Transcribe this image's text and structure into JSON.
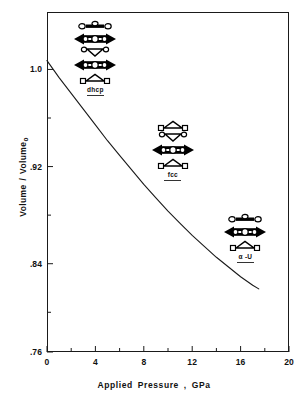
{
  "chart_data": {
    "type": "line",
    "title": "",
    "xlabel": "Applied  Pressure , GPa",
    "ylabel": "Volume / Volume",
    "ylabel_subscript": "o",
    "xlim": [
      0,
      20
    ],
    "ylim": [
      0.76,
      1.04
    ],
    "grid": false,
    "legend": "none",
    "x_ticks": [
      0,
      4,
      8,
      12,
      16,
      20
    ],
    "x_tick_labels": [
      "0",
      "4",
      "8",
      "12",
      "16",
      "20"
    ],
    "x_minor_ticks": [
      2,
      6,
      10,
      14,
      18
    ],
    "y_ticks": [
      1.0,
      0.92,
      0.84,
      0.76
    ],
    "y_tick_labels": [
      "1.0",
      ".92",
      ".84",
      ".76"
    ],
    "y_minor_ticks": [
      0.96,
      0.88,
      0.8
    ],
    "series": [
      {
        "name": "compression curve",
        "x": [
          0,
          1,
          2,
          3,
          4,
          5,
          6,
          7,
          8,
          9,
          10,
          11,
          12,
          13,
          14,
          15,
          16,
          17,
          17.5
        ],
        "y": [
          1.0,
          0.986,
          0.973,
          0.96,
          0.947,
          0.934,
          0.922,
          0.91,
          0.898,
          0.887,
          0.876,
          0.866,
          0.856,
          0.847,
          0.838,
          0.83,
          0.822,
          0.815,
          0.812
        ]
      }
    ],
    "annotations": [
      {
        "label": "dhcp",
        "x": 4.0,
        "y": 1.005,
        "layers": [
          "wide-row",
          "double-arrow",
          "down-triangle",
          "double-arrow",
          "up-triangle"
        ]
      },
      {
        "label": "fcc",
        "x": 10.4,
        "y": 0.928,
        "layers": [
          "up-triangle",
          "down-triangle",
          "double-arrow",
          "up-triangle"
        ]
      },
      {
        "label": "α -U",
        "x": 16.4,
        "y": 0.855,
        "layers": [
          "wide-row",
          "double-arrow",
          "up-triangle"
        ]
      }
    ],
    "colors": {
      "curve": "#1a1a1a",
      "axis": "#1a1a1a",
      "text": "#111111",
      "structure_fill": "#000000",
      "structure_outline": "#000000",
      "background": "#ffffff"
    }
  }
}
